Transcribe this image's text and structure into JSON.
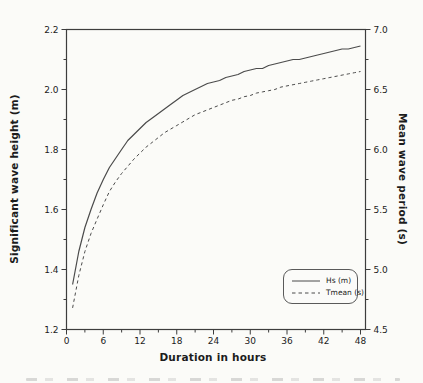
{
  "figure": {
    "background": "#fbfbf8",
    "axis_color": "#3d3d3d",
    "curve_color": "#4b4b4b",
    "text_color": "#1c1c1c"
  },
  "chart_data": {
    "type": "line",
    "title": "",
    "xlabel": "Duration in hours",
    "ylabel_left": "Significant wave height (m)",
    "ylabel_right": "Mean wave period (s)",
    "x_range": [
      0,
      48
    ],
    "left_range": [
      1.2,
      2.2
    ],
    "right_range": [
      4.5,
      7.0
    ],
    "grid": false,
    "x_ticks_major": [
      0,
      6,
      12,
      18,
      24,
      30,
      36,
      42,
      48
    ],
    "x_tick_labels": [
      "0",
      "6",
      "12",
      "18",
      "24",
      "30",
      "36",
      "42",
      "48"
    ],
    "x_ticks_minor": [
      3,
      9,
      15,
      21,
      27,
      33,
      39,
      45
    ],
    "left_ticks_major": [
      1.2,
      1.4,
      1.6,
      1.8,
      2.0,
      2.2
    ],
    "left_tick_labels": [
      "1.2",
      "1.4",
      "1.6",
      "1.8",
      "2.0",
      "2.2"
    ],
    "left_ticks_minor": [
      1.3,
      1.5,
      1.7,
      1.9,
      2.1
    ],
    "right_ticks_major": [
      4.5,
      5.0,
      5.5,
      6.0,
      6.5,
      7.0
    ],
    "right_tick_labels": [
      "4.5",
      "5.0",
      "5.5",
      "6.0",
      "6.5",
      "7.0"
    ],
    "right_ticks_minor": [
      4.75,
      5.25,
      5.75,
      6.25,
      6.75
    ],
    "legend": {
      "position": "bottom-right",
      "items": [
        {
          "label": "Hs (m)",
          "style": "solid"
        },
        {
          "label": "Tmean (s)",
          "style": "dashed"
        }
      ]
    },
    "series": [
      {
        "name": "Hs (m)",
        "axis": "left",
        "style": "solid",
        "x": [
          1,
          2,
          3,
          4,
          5,
          6,
          7,
          8,
          9,
          10,
          11,
          12,
          13,
          14,
          15,
          16,
          17,
          18,
          19,
          20,
          21,
          22,
          23,
          24,
          25,
          26,
          27,
          28,
          29,
          30,
          31,
          32,
          33,
          34,
          35,
          36,
          37,
          38,
          39,
          40,
          41,
          42,
          43,
          44,
          45,
          46,
          47,
          48
        ],
        "values": [
          1.35,
          1.46,
          1.54,
          1.6,
          1.655,
          1.7,
          1.74,
          1.77,
          1.8,
          1.83,
          1.85,
          1.87,
          1.89,
          1.905,
          1.92,
          1.935,
          1.95,
          1.965,
          1.98,
          1.99,
          2.0,
          2.01,
          2.02,
          2.025,
          2.03,
          2.04,
          2.045,
          2.05,
          2.06,
          2.065,
          2.07,
          2.07,
          2.08,
          2.085,
          2.09,
          2.095,
          2.1,
          2.1,
          2.105,
          2.11,
          2.115,
          2.12,
          2.125,
          2.13,
          2.135,
          2.135,
          2.14,
          2.145
        ]
      },
      {
        "name": "Tmean (s)",
        "axis": "right",
        "style": "dashed",
        "x": [
          1,
          2,
          3,
          4,
          5,
          6,
          7,
          8,
          9,
          10,
          11,
          12,
          13,
          14,
          15,
          16,
          17,
          18,
          19,
          20,
          21,
          22,
          23,
          24,
          25,
          26,
          27,
          28,
          29,
          30,
          31,
          32,
          33,
          34,
          35,
          36,
          37,
          38,
          39,
          40,
          41,
          42,
          43,
          44,
          45,
          46,
          47,
          48
        ],
        "values": [
          4.68,
          4.95,
          5.15,
          5.3,
          5.42,
          5.54,
          5.65,
          5.73,
          5.8,
          5.86,
          5.92,
          5.97,
          6.02,
          6.06,
          6.1,
          6.14,
          6.17,
          6.2,
          6.23,
          6.26,
          6.29,
          6.31,
          6.33,
          6.35,
          6.37,
          6.39,
          6.41,
          6.42,
          6.44,
          6.45,
          6.47,
          6.48,
          6.49,
          6.5,
          6.52,
          6.53,
          6.54,
          6.55,
          6.56,
          6.57,
          6.58,
          6.59,
          6.6,
          6.61,
          6.62,
          6.63,
          6.64,
          6.65
        ]
      }
    ]
  }
}
